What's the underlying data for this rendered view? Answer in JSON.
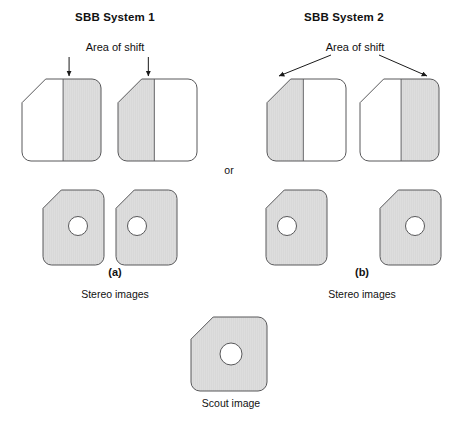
{
  "figure": {
    "background_color": "#ffffff",
    "stroke_color": "#58585a",
    "text_color": "#111111",
    "shade_color": "#d8d8d8",
    "unshaded_color": "#ffffff",
    "width": 459,
    "height": 436
  },
  "systems": [
    {
      "id": "system-1",
      "title": "SBB System 1",
      "title_x": 115,
      "title_y": 17,
      "shift_label": "Area of shift",
      "shift_label_x": 115,
      "shift_label_y": 47,
      "arrow_style": "vertical",
      "panel_letter": "(a)",
      "panel_letter_x": 115,
      "panel_letter_y": 272,
      "caption": "Stereo images",
      "caption_x": 115,
      "caption_y": 294,
      "top_shapes": [
        {
          "name": "sbb1-top-left-image",
          "x": 22,
          "y": 79,
          "w": 79,
          "h": 82,
          "shaded_side": "right",
          "split": 0.52
        },
        {
          "name": "sbb1-top-right-image",
          "x": 118,
          "y": 79,
          "w": 79,
          "h": 82,
          "shaded_side": "left",
          "split": 0.46
        }
      ],
      "bottom_shapes": [
        {
          "name": "sbb1-stereo-left-image",
          "x": 43,
          "y": 190,
          "w": 61,
          "h": 75,
          "circle_cx": 78,
          "circle_cy": 226,
          "circle_r": 9.5
        },
        {
          "name": "sbb1-stereo-right-image",
          "x": 116,
          "y": 190,
          "w": 61,
          "h": 75,
          "circle_cx": 137,
          "circle_cy": 226,
          "circle_r": 9.5
        }
      ]
    },
    {
      "id": "system-2",
      "title": "SBB System 2",
      "title_x": 344,
      "title_y": 17,
      "shift_label": "Area of shift",
      "shift_label_x": 355,
      "shift_label_y": 47,
      "arrow_style": "diagonal",
      "panel_letter": "(b)",
      "panel_letter_x": 362,
      "panel_letter_y": 272,
      "caption": "Stereo images",
      "caption_x": 362,
      "caption_y": 294,
      "top_shapes": [
        {
          "name": "sbb2-top-left-image",
          "x": 267,
          "y": 79,
          "w": 79,
          "h": 82,
          "shaded_side": "left",
          "split": 0.46
        },
        {
          "name": "sbb2-top-right-image",
          "x": 360,
          "y": 79,
          "w": 79,
          "h": 82,
          "shaded_side": "right",
          "split": 0.52
        }
      ],
      "bottom_shapes": [
        {
          "name": "sbb2-stereo-left-image",
          "x": 266,
          "y": 190,
          "w": 61,
          "h": 75,
          "circle_cx": 287,
          "circle_cy": 226,
          "circle_r": 9.5
        },
        {
          "name": "sbb2-stereo-right-image",
          "x": 380,
          "y": 190,
          "w": 61,
          "h": 75,
          "circle_cx": 415,
          "circle_cy": 226,
          "circle_r": 9.5
        }
      ]
    }
  ],
  "connector": {
    "label": "or",
    "x": 229,
    "y": 170
  },
  "scout": {
    "name": "scout-image",
    "label": "Scout image",
    "label_x": 231,
    "label_y": 403,
    "x": 191,
    "y": 317,
    "w": 76,
    "h": 74,
    "circle_cx": 231,
    "circle_cy": 354,
    "circle_r": 11
  }
}
